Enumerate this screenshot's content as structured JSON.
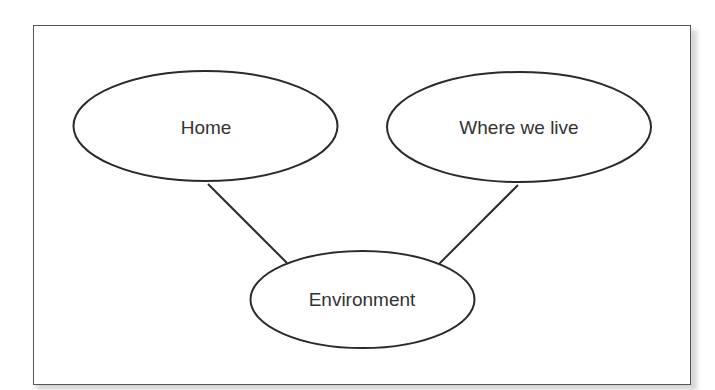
{
  "diagram": {
    "type": "concept-map",
    "nodes": [
      {
        "id": "home",
        "label": "Home",
        "shape": "ellipse"
      },
      {
        "id": "where_we_live",
        "label": "Where we live",
        "shape": "ellipse"
      },
      {
        "id": "environment",
        "label": "Environment",
        "shape": "ellipse"
      }
    ],
    "edges": [
      {
        "from": "home",
        "to": "environment"
      },
      {
        "from": "where_we_live",
        "to": "environment"
      }
    ],
    "colors": {
      "stroke": "#2a2a2a",
      "text": "#333333",
      "frame": "#555555",
      "background": "#ffffff"
    }
  }
}
